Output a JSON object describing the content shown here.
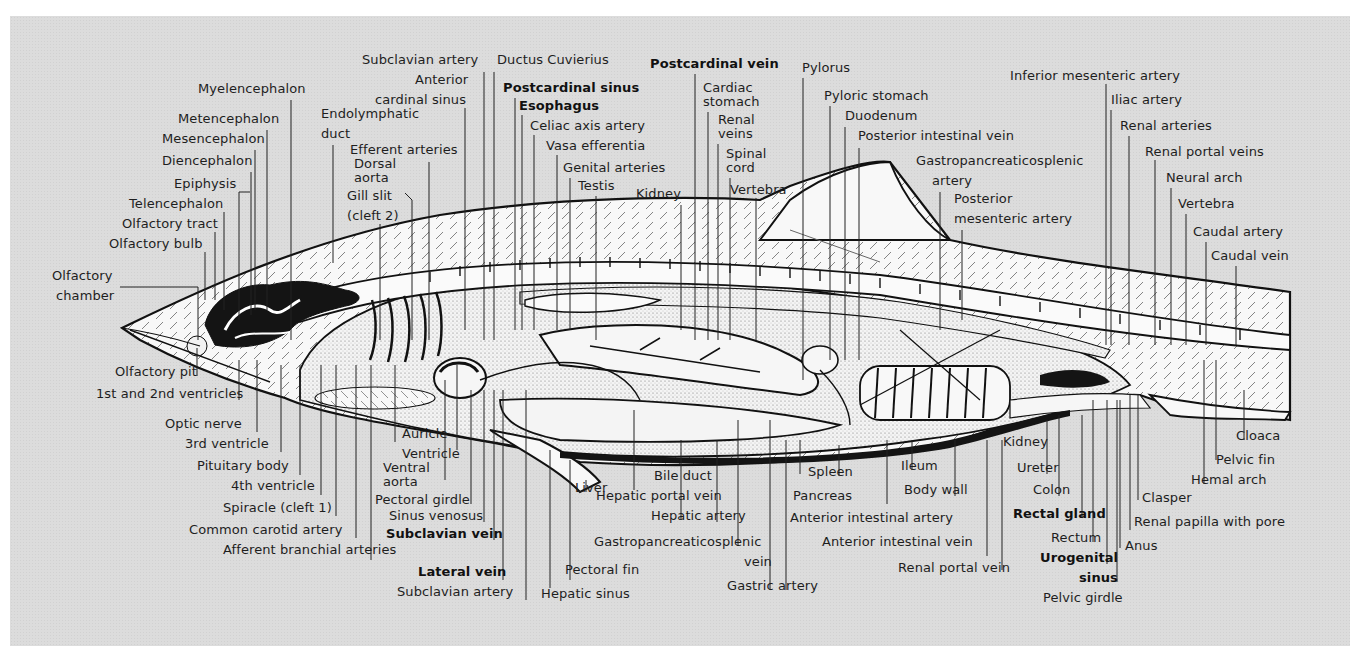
{
  "figure": {
    "colors": {
      "panel_bg": "#dcdcdc",
      "ink": "#111111",
      "body_fill": "#f7f7f7",
      "dark_tissue": "#141414",
      "stipple": "#8a8a8a"
    }
  },
  "labels": [
    {
      "id": "myelencephalon",
      "text": "Myelencephalon",
      "x": 198,
      "y": 93,
      "ax": "l"
    },
    {
      "id": "metencephalon",
      "text": "Metencephalon",
      "x": 178,
      "y": 123,
      "ax": "l"
    },
    {
      "id": "mesencephalon",
      "text": "Mesencephalon",
      "x": 162,
      "y": 143,
      "ax": "l"
    },
    {
      "id": "diencephalon",
      "text": "Diencephalon",
      "x": 162,
      "y": 165,
      "ax": "l"
    },
    {
      "id": "epiphysis",
      "text": "Epiphysis",
      "x": 174,
      "y": 188,
      "ax": "l"
    },
    {
      "id": "telencephalon",
      "text": "Telencephalon",
      "x": 129,
      "y": 208,
      "ax": "l"
    },
    {
      "id": "olfactory-tract",
      "text": "Olfactory tract",
      "x": 122,
      "y": 228,
      "ax": "l"
    },
    {
      "id": "olfactory-bulb",
      "text": "Olfactory bulb",
      "x": 109,
      "y": 248,
      "ax": "l"
    },
    {
      "id": "olfactory-chamber-1",
      "text": "Olfactory",
      "x": 52,
      "y": 280,
      "ax": "l"
    },
    {
      "id": "olfactory-chamber-2",
      "text": "chamber",
      "x": 56,
      "y": 300,
      "ax": "l"
    },
    {
      "id": "endolymphatic-duct-1",
      "text": "Endolymphatic",
      "x": 321,
      "y": 118,
      "ax": "l"
    },
    {
      "id": "endolymphatic-duct-2",
      "text": "duct",
      "x": 321,
      "y": 138,
      "ax": "l"
    },
    {
      "id": "subclavian-artery-top",
      "text": "Subclavian artery",
      "x": 362,
      "y": 64,
      "ax": "l"
    },
    {
      "id": "anterior-cardinal-sinus-1",
      "text": "Anterior",
      "x": 415,
      "y": 84,
      "ax": "l"
    },
    {
      "id": "anterior-cardinal-sinus-2",
      "text": "cardinal sinus",
      "x": 375,
      "y": 104,
      "ax": "l"
    },
    {
      "id": "efferent-arteries",
      "text": "Efferent arteries",
      "x": 350,
      "y": 154,
      "ax": "l"
    },
    {
      "id": "dorsal-aorta-1",
      "text": "Dorsal",
      "x": 354,
      "y": 168,
      "ax": "l"
    },
    {
      "id": "dorsal-aorta-2",
      "text": "aorta",
      "x": 354,
      "y": 182,
      "ax": "l"
    },
    {
      "id": "gill-slit-1",
      "text": "Gill slit",
      "x": 347,
      "y": 200,
      "ax": "l"
    },
    {
      "id": "gill-slit-2",
      "text": "(cleft 2)",
      "x": 347,
      "y": 220,
      "ax": "l"
    },
    {
      "id": "ductus-cuvierius",
      "text": "Ductus Cuvierius",
      "x": 497,
      "y": 64,
      "ax": "l"
    },
    {
      "id": "postcardinal-sinus",
      "text": "Postcardinal sinus",
      "x": 503,
      "y": 92,
      "ax": "l",
      "bold": true
    },
    {
      "id": "esophagus",
      "text": "Esophagus",
      "x": 519,
      "y": 110,
      "ax": "l",
      "bold": true
    },
    {
      "id": "celiac-axis-artery",
      "text": "Celiac axis artery",
      "x": 530,
      "y": 130,
      "ax": "l"
    },
    {
      "id": "vasa-efferentia",
      "text": "Vasa efferentia",
      "x": 546,
      "y": 150,
      "ax": "l"
    },
    {
      "id": "genital-arteries",
      "text": "Genital arteries",
      "x": 563,
      "y": 172,
      "ax": "l"
    },
    {
      "id": "testis",
      "text": "Testis",
      "x": 578,
      "y": 190,
      "ax": "l"
    },
    {
      "id": "kidney-top",
      "text": "Kidney",
      "x": 636,
      "y": 198,
      "ax": "l"
    },
    {
      "id": "postcardinal-vein",
      "text": "Postcardinal vein",
      "x": 650,
      "y": 68,
      "ax": "l",
      "bold": true
    },
    {
      "id": "cardiac-stomach-1",
      "text": "Cardiac",
      "x": 703,
      "y": 92,
      "ax": "l"
    },
    {
      "id": "cardiac-stomach-2",
      "text": "stomach",
      "x": 703,
      "y": 106,
      "ax": "l"
    },
    {
      "id": "renal-veins-1",
      "text": "Renal",
      "x": 718,
      "y": 124,
      "ax": "l"
    },
    {
      "id": "renal-veins-2",
      "text": "veins",
      "x": 718,
      "y": 138,
      "ax": "l"
    },
    {
      "id": "spinal-cord-1",
      "text": "Spinal",
      "x": 726,
      "y": 158,
      "ax": "l"
    },
    {
      "id": "spinal-cord-2",
      "text": "cord",
      "x": 726,
      "y": 172,
      "ax": "l"
    },
    {
      "id": "vertebra-top",
      "text": "Vertebra",
      "x": 730,
      "y": 194,
      "ax": "l"
    },
    {
      "id": "pylorus",
      "text": "Pylorus",
      "x": 802,
      "y": 72,
      "ax": "l"
    },
    {
      "id": "pyloric-stomach",
      "text": "Pyloric stomach",
      "x": 824,
      "y": 100,
      "ax": "l"
    },
    {
      "id": "duodenum",
      "text": "Duodenum",
      "x": 845,
      "y": 120,
      "ax": "l"
    },
    {
      "id": "posterior-intestinal-vein",
      "text": "Posterior intestinal vein",
      "x": 858,
      "y": 140,
      "ax": "l"
    },
    {
      "id": "gastropancreaticosplenic-artery-1",
      "text": "Gastropancreaticosplenic",
      "x": 916,
      "y": 165,
      "ax": "l"
    },
    {
      "id": "gastropancreaticosplenic-artery-2",
      "text": "artery",
      "x": 932,
      "y": 185,
      "ax": "l"
    },
    {
      "id": "posterior-mesenteric-artery-1",
      "text": "Posterior",
      "x": 954,
      "y": 203,
      "ax": "l"
    },
    {
      "id": "posterior-mesenteric-artery-2",
      "text": "mesenteric artery",
      "x": 954,
      "y": 223,
      "ax": "l"
    },
    {
      "id": "inferior-mesenteric-artery",
      "text": "Inferior mesenteric artery",
      "x": 1010,
      "y": 80,
      "ax": "l"
    },
    {
      "id": "iliac-artery",
      "text": "Iliac artery",
      "x": 1111,
      "y": 104,
      "ax": "l"
    },
    {
      "id": "renal-arteries",
      "text": "Renal arteries",
      "x": 1120,
      "y": 130,
      "ax": "l"
    },
    {
      "id": "renal-portal-veins",
      "text": "Renal portal veins",
      "x": 1145,
      "y": 156,
      "ax": "l"
    },
    {
      "id": "neural-arch",
      "text": "Neural arch",
      "x": 1166,
      "y": 182,
      "ax": "l"
    },
    {
      "id": "vertebra-tail",
      "text": "Vertebra",
      "x": 1178,
      "y": 208,
      "ax": "l"
    },
    {
      "id": "caudal-artery",
      "text": "Caudal artery",
      "x": 1193,
      "y": 236,
      "ax": "l"
    },
    {
      "id": "caudal-vein",
      "text": "Caudal vein",
      "x": 1211,
      "y": 260,
      "ax": "l"
    },
    {
      "id": "olfactory-pit",
      "text": "Olfactory pit",
      "x": 115,
      "y": 376,
      "ax": "l"
    },
    {
      "id": "ventricles-1-2",
      "text": "1st and 2nd ventricles",
      "x": 96,
      "y": 398,
      "ax": "l"
    },
    {
      "id": "optic-nerve",
      "text": "Optic nerve",
      "x": 165,
      "y": 428,
      "ax": "l"
    },
    {
      "id": "third-ventricle",
      "text": "3rd ventricle",
      "x": 185,
      "y": 448,
      "ax": "l"
    },
    {
      "id": "pituitary-body",
      "text": "Pituitary body",
      "x": 197,
      "y": 470,
      "ax": "l"
    },
    {
      "id": "fourth-ventricle",
      "text": "4th ventricle",
      "x": 231,
      "y": 490,
      "ax": "l"
    },
    {
      "id": "spiracle",
      "text": "Spiracle (cleft 1)",
      "x": 223,
      "y": 512,
      "ax": "l"
    },
    {
      "id": "common-carotid-artery",
      "text": "Common carotid artery",
      "x": 189,
      "y": 534,
      "ax": "l"
    },
    {
      "id": "afferent-branchial-arteries",
      "text": "Afferent branchial arteries",
      "x": 223,
      "y": 554,
      "ax": "l"
    },
    {
      "id": "auricle",
      "text": "Auricle",
      "x": 402,
      "y": 438,
      "ax": "l"
    },
    {
      "id": "ventricle",
      "text": "Ventricle",
      "x": 402,
      "y": 458,
      "ax": "l"
    },
    {
      "id": "ventral-aorta-1",
      "text": "Ventral",
      "x": 383,
      "y": 472,
      "ax": "l"
    },
    {
      "id": "ventral-aorta-2",
      "text": "aorta",
      "x": 383,
      "y": 486,
      "ax": "l"
    },
    {
      "id": "pectoral-girdle",
      "text": "Pectoral girdle",
      "x": 375,
      "y": 504,
      "ax": "l"
    },
    {
      "id": "sinus-venosus",
      "text": "Sinus venosus",
      "x": 389,
      "y": 520,
      "ax": "l"
    },
    {
      "id": "subclavian-vein",
      "text": "Subclavian vein",
      "x": 386,
      "y": 538,
      "ax": "l",
      "bold": true
    },
    {
      "id": "lateral-vein",
      "text": "Lateral vein",
      "x": 418,
      "y": 576,
      "ax": "l",
      "bold": true
    },
    {
      "id": "subclavian-artery-bottom",
      "text": "Subclavian artery",
      "x": 397,
      "y": 596,
      "ax": "l"
    },
    {
      "id": "hepatic-sinus",
      "text": "Hepatic sinus",
      "x": 541,
      "y": 598,
      "ax": "l"
    },
    {
      "id": "liver",
      "text": "Liver",
      "x": 575,
      "y": 492,
      "ax": "l"
    },
    {
      "id": "pectoral-fin",
      "text": "Pectoral fin",
      "x": 565,
      "y": 574,
      "ax": "l"
    },
    {
      "id": "bile-duct",
      "text": "Bile duct",
      "x": 654,
      "y": 480,
      "ax": "l"
    },
    {
      "id": "hepatic-portal-vein",
      "text": "Hepatic portal vein",
      "x": 596,
      "y": 500,
      "ax": "l"
    },
    {
      "id": "hepatic-artery",
      "text": "Hepatic artery",
      "x": 651,
      "y": 520,
      "ax": "l"
    },
    {
      "id": "gastropancreaticosplenic-vein-1",
      "text": "Gastropancreaticosplenic",
      "x": 594,
      "y": 546,
      "ax": "l"
    },
    {
      "id": "gastropancreaticosplenic-vein-2",
      "text": "vein",
      "x": 744,
      "y": 566,
      "ax": "l"
    },
    {
      "id": "gastric-artery",
      "text": "Gastric artery",
      "x": 727,
      "y": 590,
      "ax": "l"
    },
    {
      "id": "spleen",
      "text": "Spleen",
      "x": 808,
      "y": 476,
      "ax": "l"
    },
    {
      "id": "pancreas",
      "text": "Pancreas",
      "x": 793,
      "y": 500,
      "ax": "l"
    },
    {
      "id": "anterior-intestinal-artery",
      "text": "Anterior intestinal artery",
      "x": 790,
      "y": 522,
      "ax": "l"
    },
    {
      "id": "anterior-intestinal-vein",
      "text": "Anterior intestinal vein",
      "x": 822,
      "y": 546,
      "ax": "l"
    },
    {
      "id": "ileum",
      "text": "Ileum",
      "x": 901,
      "y": 470,
      "ax": "l"
    },
    {
      "id": "body-wall",
      "text": "Body wall",
      "x": 904,
      "y": 494,
      "ax": "l"
    },
    {
      "id": "renal-portal-vein",
      "text": "Renal portal vein",
      "x": 898,
      "y": 572,
      "ax": "l"
    },
    {
      "id": "kidney-bottom",
      "text": "Kidney",
      "x": 1003,
      "y": 446,
      "ax": "l"
    },
    {
      "id": "ureter",
      "text": "Ureter",
      "x": 1017,
      "y": 472,
      "ax": "l"
    },
    {
      "id": "colon",
      "text": "Colon",
      "x": 1033,
      "y": 494,
      "ax": "l"
    },
    {
      "id": "rectal-gland",
      "text": "Rectal gland",
      "x": 1013,
      "y": 518,
      "ax": "l",
      "bold": true
    },
    {
      "id": "rectum",
      "text": "Rectum",
      "x": 1051,
      "y": 542,
      "ax": "l"
    },
    {
      "id": "urogenital-sinus-1",
      "text": "Urogenital",
      "x": 1040,
      "y": 562,
      "ax": "l",
      "bold": true
    },
    {
      "id": "urogenital-sinus-2",
      "text": "sinus",
      "x": 1079,
      "y": 582,
      "ax": "l",
      "bold": true
    },
    {
      "id": "pelvic-girdle",
      "text": "Pelvic girdle",
      "x": 1043,
      "y": 602,
      "ax": "l"
    },
    {
      "id": "anus",
      "text": "Anus",
      "x": 1125,
      "y": 550,
      "ax": "l"
    },
    {
      "id": "renal-papilla",
      "text": "Renal papilla with pore",
      "x": 1134,
      "y": 526,
      "ax": "l"
    },
    {
      "id": "clasper",
      "text": "Clasper",
      "x": 1142,
      "y": 502,
      "ax": "l"
    },
    {
      "id": "hemal-arch",
      "text": "Hemal arch",
      "x": 1191,
      "y": 484,
      "ax": "l"
    },
    {
      "id": "pelvic-fin",
      "text": "Pelvic fin",
      "x": 1216,
      "y": 464,
      "ax": "l"
    },
    {
      "id": "cloaca",
      "text": "Cloaca",
      "x": 1236,
      "y": 440,
      "ax": "l"
    }
  ],
  "leader_lines": [
    [
      291,
      100,
      291,
      340
    ],
    [
      267,
      130,
      267,
      310
    ],
    [
      255,
      150,
      255,
      310
    ],
    [
      251,
      172,
      251,
      315
    ],
    [
      239,
      192,
      250,
      192
    ],
    [
      239,
      192,
      239,
      320
    ],
    [
      224,
      212,
      224,
      310
    ],
    [
      215,
      232,
      215,
      300
    ],
    [
      205,
      252,
      205,
      300
    ],
    [
      120,
      287,
      198,
      287
    ],
    [
      198,
      287,
      198,
      340
    ],
    [
      333,
      145,
      333,
      263
    ],
    [
      484,
      72,
      484,
      340
    ],
    [
      465,
      108,
      465,
      330
    ],
    [
      429,
      162,
      429,
      340
    ],
    [
      405,
      193,
      412,
      200
    ],
    [
      412,
      200,
      412,
      340
    ],
    [
      380,
      224,
      380,
      340
    ],
    [
      494,
      72,
      494,
      340
    ],
    [
      515,
      98,
      515,
      330
    ],
    [
      522,
      115,
      522,
      330
    ],
    [
      534,
      135,
      534,
      330
    ],
    [
      557,
      155,
      557,
      330
    ],
    [
      570,
      178,
      570,
      330
    ],
    [
      596,
      196,
      596,
      340
    ],
    [
      681,
      205,
      681,
      330
    ],
    [
      695,
      74,
      695,
      340
    ],
    [
      708,
      112,
      708,
      340
    ],
    [
      718,
      144,
      718,
      340
    ],
    [
      730,
      178,
      730,
      340
    ],
    [
      756,
      198,
      756,
      340
    ],
    [
      803,
      78,
      803,
      380
    ],
    [
      830,
      106,
      830,
      360
    ],
    [
      845,
      127,
      845,
      360
    ],
    [
      859,
      148,
      859,
      360
    ],
    [
      940,
      192,
      940,
      330
    ],
    [
      962,
      230,
      962,
      320
    ],
    [
      1106,
      84,
      1106,
      345
    ],
    [
      1111,
      110,
      1111,
      345
    ],
    [
      1129,
      136,
      1129,
      345
    ],
    [
      1155,
      160,
      1155,
      345
    ],
    [
      1171,
      188,
      1171,
      345
    ],
    [
      1186,
      214,
      1186,
      345
    ],
    [
      1206,
      242,
      1206,
      345
    ],
    [
      1236,
      266,
      1236,
      345
    ],
    [
      197,
      348,
      197,
      376
    ],
    [
      239,
      360,
      239,
      400
    ],
    [
      257,
      360,
      257,
      432
    ],
    [
      281,
      365,
      281,
      452
    ],
    [
      300,
      365,
      300,
      475
    ],
    [
      321,
      365,
      321,
      495
    ],
    [
      336,
      365,
      336,
      516
    ],
    [
      356,
      365,
      356,
      538
    ],
    [
      371,
      365,
      371,
      560
    ],
    [
      395,
      365,
      395,
      442
    ],
    [
      457,
      365,
      457,
      450
    ],
    [
      445,
      380,
      445,
      480
    ],
    [
      471,
      390,
      471,
      504
    ],
    [
      484,
      390,
      484,
      522
    ],
    [
      494,
      390,
      494,
      540
    ],
    [
      503,
      390,
      503,
      580
    ],
    [
      526,
      390,
      526,
      600
    ],
    [
      550,
      450,
      550,
      588
    ],
    [
      570,
      460,
      570,
      580
    ],
    [
      586,
      480,
      586,
      492
    ],
    [
      634,
      410,
      634,
      490
    ],
    [
      681,
      440,
      681,
      520
    ],
    [
      717,
      440,
      717,
      522
    ],
    [
      738,
      420,
      738,
      546
    ],
    [
      770,
      420,
      770,
      590
    ],
    [
      786,
      440,
      786,
      590
    ],
    [
      800,
      440,
      800,
      474
    ],
    [
      839,
      445,
      839,
      476
    ],
    [
      887,
      440,
      887,
      504
    ],
    [
      912,
      440,
      912,
      470
    ],
    [
      955,
      440,
      955,
      496
    ],
    [
      987,
      440,
      987,
      556
    ],
    [
      1002,
      440,
      1002,
      570
    ],
    [
      1047,
      420,
      1047,
      474
    ],
    [
      1059,
      415,
      1059,
      496
    ],
    [
      1082,
      415,
      1082,
      518
    ],
    [
      1093,
      400,
      1093,
      542
    ],
    [
      1107,
      400,
      1107,
      564
    ],
    [
      1117,
      400,
      1117,
      582
    ],
    [
      1120,
      400,
      1120,
      548
    ],
    [
      1130,
      395,
      1130,
      530
    ],
    [
      1138,
      395,
      1138,
      500
    ],
    [
      1204,
      360,
      1204,
      484
    ],
    [
      1216,
      360,
      1216,
      460
    ],
    [
      1244,
      390,
      1244,
      440
    ]
  ]
}
